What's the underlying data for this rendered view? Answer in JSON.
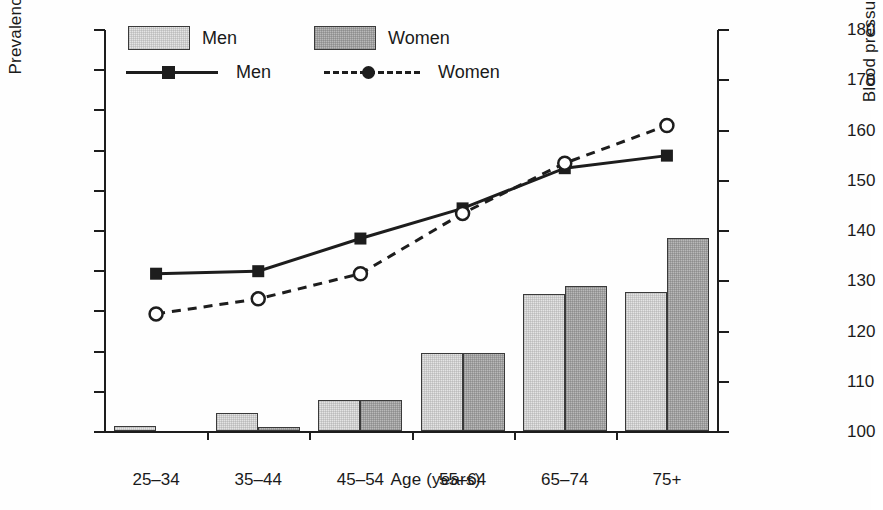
{
  "chart_data": {
    "type": "bar",
    "title": "",
    "subtitle": "",
    "xlabel": "Age (years)",
    "ylabel": "Prevalence (%)",
    "ylabel_secondary": "Blood pressure (mmHg)",
    "categories": [
      "25–34",
      "35–44",
      "45–54",
      "55–64",
      "65–74",
      "75+"
    ],
    "ylim": [
      0,
      100
    ],
    "yticks": [
      0,
      10,
      20,
      30,
      40,
      50,
      60,
      70,
      80,
      90,
      100
    ],
    "ylim_secondary": [
      100,
      180
    ],
    "yticks_secondary": [
      100,
      110,
      120,
      130,
      140,
      150,
      160,
      170,
      180
    ],
    "grid": false,
    "legend_position": "top-left",
    "bar_series": [
      {
        "name": "Men",
        "axis": "left",
        "values": [
          1.2,
          4.5,
          7.6,
          19.4,
          34.0,
          34.5
        ]
      },
      {
        "name": "Women",
        "axis": "left",
        "values": [
          0.0,
          1.1,
          7.6,
          19.4,
          36.0,
          48.0
        ]
      }
    ],
    "line_series": [
      {
        "name": "Men",
        "axis": "right",
        "marker": "filled-square",
        "line": "solid",
        "values": [
          131.5,
          132.0,
          138.5,
          144.5,
          152.5,
          155.0
        ]
      },
      {
        "name": "Women",
        "axis": "right",
        "marker": "open-circle",
        "line": "dashed",
        "values": [
          123.5,
          126.5,
          131.5,
          143.5,
          153.5,
          161.0
        ]
      }
    ],
    "legend": {
      "bars": [
        {
          "label": "Men",
          "swatch": "light-gray-stipple"
        },
        {
          "label": "Women",
          "swatch": "dark-gray-stipple"
        }
      ],
      "lines": [
        {
          "label": "Men",
          "style": "solid-with-filled-square"
        },
        {
          "label": "Women",
          "style": "dashed-with-open-circle"
        }
      ]
    },
    "colors": {
      "bar_men": "#e4e4e4",
      "bar_women": "#b9b9b9",
      "line": "#1d1d1d",
      "axis": "#1d1d1d",
      "background": "#fefefe"
    }
  }
}
